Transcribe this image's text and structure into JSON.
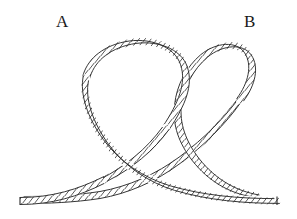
{
  "figure": {
    "kind": "line-drawing",
    "width": 297,
    "height": 219,
    "background_color": "#ffffff",
    "ink_color": "#1a1a1a",
    "rope": {
      "stroke_color": "#2b2b2b",
      "fill_color": "#ffffff",
      "strand_color": "#3a3a3a",
      "width_px": 7,
      "strand_spacing_px": 6
    }
  },
  "labels": [
    {
      "id": "label-a",
      "text": "A",
      "x": 56,
      "y": 13,
      "describes": "left loop"
    },
    {
      "id": "label-b",
      "text": "B",
      "x": 244,
      "y": 13,
      "describes": "right loop"
    }
  ],
  "parts": [
    {
      "name": "left-rope-end",
      "description": "flat cut end at lower left"
    },
    {
      "name": "left-loop",
      "description": "large loop rising to upper left, labeled A"
    },
    {
      "name": "right-loop",
      "description": "large loop rising to upper right, labeled B"
    },
    {
      "name": "center-crossing",
      "description": "strands cross over one another at the middle"
    },
    {
      "name": "right-rope-end",
      "description": "flat cut end at lower right"
    }
  ]
}
